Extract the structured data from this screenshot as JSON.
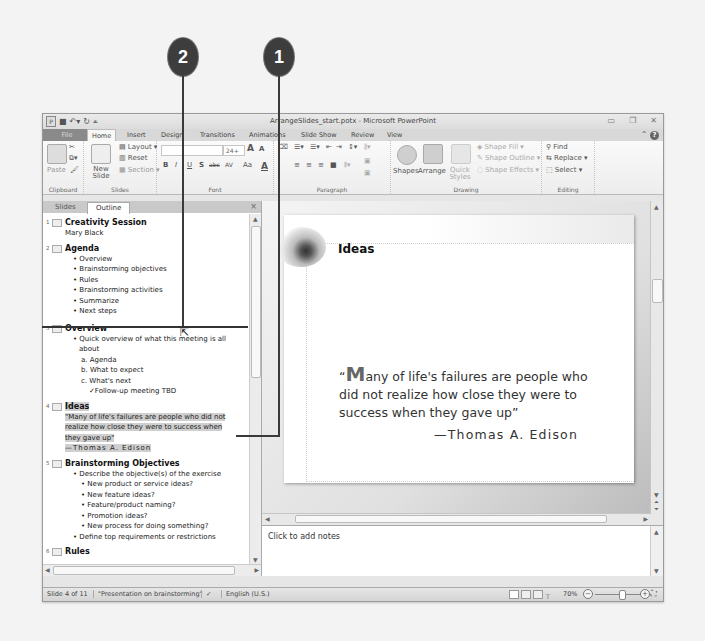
{
  "callouts": [
    {
      "number": "1"
    },
    {
      "number": "2"
    }
  ],
  "window": {
    "title": "ArrangeSlides_start.potx - Microsoft PowerPoint",
    "controls": {
      "minimize": "▭",
      "restore": "❐",
      "close": "✕"
    }
  },
  "ribbon_tabs": [
    "File",
    "Home",
    "Insert",
    "Design",
    "Transitions",
    "Animations",
    "Slide Show",
    "Review",
    "View"
  ],
  "ribbon": {
    "clipboard": {
      "label": "Clipboard",
      "paste": "Paste"
    },
    "slides": {
      "label": "Slides",
      "new_slide": "New Slide",
      "layout": "Layout",
      "reset": "Reset",
      "section": "Section"
    },
    "font": {
      "label": "Font",
      "size": "24+",
      "bold": "B",
      "italic": "I",
      "underline": "U",
      "strike": "S",
      "shadow": "abc",
      "spacing": "AV",
      "case": "Aa",
      "grow": "A",
      "shrink": "A",
      "color": "A"
    },
    "paragraph": {
      "label": "Paragraph"
    },
    "drawing": {
      "label": "Drawing",
      "shapes": "Shapes",
      "arrange": "Arrange",
      "quick_styles": "Quick Styles",
      "shape_fill": "Shape Fill",
      "shape_outline": "Shape Outline",
      "shape_effects": "Shape Effects"
    },
    "editing": {
      "label": "Editing",
      "find": "Find",
      "replace": "Replace",
      "select": "Select"
    }
  },
  "left_pane": {
    "tabs": [
      "Slides",
      "Outline"
    ],
    "active_tab": "Outline",
    "close": "×"
  },
  "outline": {
    "s1": {
      "num": "1",
      "title": "Creativity Session",
      "sub": "Mary Black"
    },
    "s2": {
      "num": "2",
      "title": "Agenda",
      "items": [
        "Overview",
        "Brainstorming objectives",
        "Rules",
        "Brainstorming activities",
        "Summarize",
        "Next steps"
      ]
    },
    "s3": {
      "num": "3",
      "title": "Overview",
      "b1": "Quick overview of what this meeting is all",
      "b1b": "about",
      "a": "a. Agenda",
      "b": "b. What to expect",
      "c": "c. What's next",
      "d": "✓Follow-up meeting TBD"
    },
    "s4": {
      "num": "4",
      "title": "Ideas",
      "q1": "\"Many of life's failures are people who did not",
      "q2": "realize how close they were to success when",
      "q3": "they gave up\"",
      "author": "—Thomas A. Edison"
    },
    "s5": {
      "num": "5",
      "title": "Brainstorming Objectives",
      "b1": "Describe the objective(s) of the exercise",
      "subs": [
        "New product or service ideas?",
        "New feature ideas?",
        "Feature/product naming?",
        "Promotion ideas?",
        "New process for doing something?"
      ],
      "b2": "Define top requirements or restrictions"
    },
    "s6": {
      "num": "6",
      "title": "Rules"
    }
  },
  "slide": {
    "title": "Ideas",
    "quote_first": "M",
    "quote_open": "“",
    "quote_rest": "any of life's failures are people who did not realize how close they were to success when they gave up”",
    "author": "—Thomas A. Edison"
  },
  "notes": {
    "placeholder": "Click to add notes"
  },
  "status": {
    "slide": "Slide 4 of 11",
    "theme": "\"Presentation on brainstorming\"",
    "language": "English (U.S.)",
    "zoom": "70%"
  }
}
